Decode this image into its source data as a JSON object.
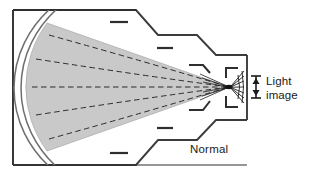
{
  "figure": {
    "title_visible": false,
    "type": "optics-ray-diagram",
    "labels": {
      "normal": "Normal",
      "light_line1": "Light",
      "light_line2": "image"
    },
    "colors": {
      "outline": "#3b3b3b",
      "frame": "#2e2e2e",
      "cone_fill": "#c9c9c9",
      "cone_edge": "#8f8f8f",
      "ray_dash": "#2b2b2b",
      "text": "#1a1a1a",
      "background": "#ffffff",
      "arc_line": "#6e6e6e"
    },
    "geometry": {
      "frame": {
        "x": 13,
        "y": 10,
        "width": 234,
        "height": 155
      },
      "focal_point": {
        "x": 229,
        "y": 87
      },
      "ray_count": 5,
      "arc_count": 2,
      "tick_marks_outside": 6
    },
    "arrow": {
      "name": "light-image-height-arrow",
      "x": 256,
      "y_top": 76,
      "y_bottom": 98,
      "double_headed": true
    }
  }
}
